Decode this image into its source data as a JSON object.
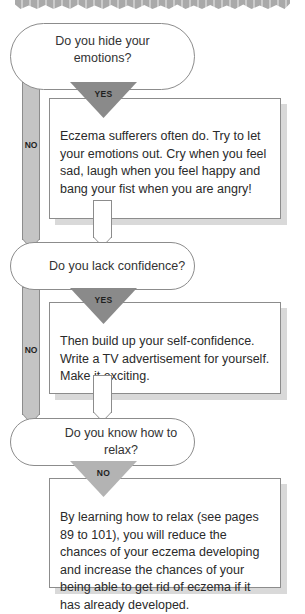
{
  "colors": {
    "outline": "#8c8c8c",
    "yes_triangle": "#8a8a8a",
    "no_triangle": "#b3b3b3",
    "no_bar": "#c4c4c4",
    "shadow": "#d9d9d9",
    "text": "#2a2a2a"
  },
  "flowchart": {
    "steps": [
      {
        "question": "Do you hide your emotions?",
        "branch_label": "YES",
        "answer": "Eczema sufferers often do. Try to let your emotions out. Cry when you feel sad, laugh when you feel happy and bang your fist when you are angry!",
        "skip_label": "NO"
      },
      {
        "question": "Do you lack confidence?",
        "branch_label": "YES",
        "answer": "Then build up your self-confidence. Write a TV advertisement for yourself. Make it exciting.",
        "skip_label": "NO"
      },
      {
        "question": "Do you know how to relax?",
        "branch_label": "NO",
        "answer": "By learning how to relax (see pages 89 to 101), you will reduce the chances of your eczema developing and increase the chances of your being able to get rid of eczema if it has already developed."
      }
    ]
  }
}
